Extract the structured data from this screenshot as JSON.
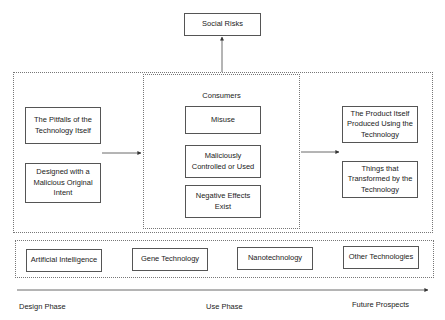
{
  "top": {
    "social_risks": "Social Risks"
  },
  "left_column": {
    "items": [
      "The Pitfalls of the Technology Itself",
      "Designed with a Malicious Original Intent"
    ]
  },
  "middle_column": {
    "title": "Consumers",
    "items": [
      "Misuse",
      "Maliciously Controlled or Used",
      "Negative Effects Exist"
    ]
  },
  "right_column": {
    "items": [
      "The Product Itself Produced Using the Technology",
      "Things that Transformed by the Technology"
    ]
  },
  "technologies": {
    "items": [
      "Artificial Intelligence",
      "Gene Technology",
      "Nanotechnology",
      "Other Technologies"
    ]
  },
  "timeline": {
    "phases": [
      "Design Phase",
      "Use Phase",
      "Future Prospects"
    ]
  }
}
